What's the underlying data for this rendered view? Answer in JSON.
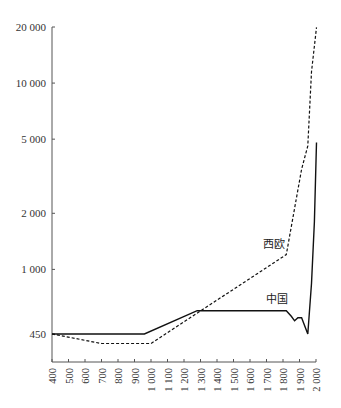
{
  "chart_data": {
    "type": "line",
    "title": "",
    "xlabel": "",
    "ylabel": "",
    "yscale": "log",
    "xlim": [
      400,
      2000
    ],
    "ylim": [
      450,
      20000
    ],
    "grid": false,
    "legend": "inline labels",
    "y_ticks": [
      {
        "value": 20000,
        "label": "20 000"
      },
      {
        "value": 10000,
        "label": "10 000"
      },
      {
        "value": 5000,
        "label": "5 000"
      },
      {
        "value": 2000,
        "label": "2 000"
      },
      {
        "value": 1000,
        "label": "1 000"
      },
      {
        "value": 450,
        "label": "450"
      }
    ],
    "x_ticks": [
      {
        "value": 400,
        "label": "400"
      },
      {
        "value": 500,
        "label": "500"
      },
      {
        "value": 600,
        "label": "600"
      },
      {
        "value": 700,
        "label": "700"
      },
      {
        "value": 800,
        "label": "800"
      },
      {
        "value": 900,
        "label": "900"
      },
      {
        "value": 1000,
        "label": "1 000"
      },
      {
        "value": 1100,
        "label": "1 100"
      },
      {
        "value": 1200,
        "label": "1 200"
      },
      {
        "value": 1300,
        "label": "1 300"
      },
      {
        "value": 1400,
        "label": "1 400"
      },
      {
        "value": 1500,
        "label": "1 500"
      },
      {
        "value": 1600,
        "label": "1 600"
      },
      {
        "value": 1700,
        "label": "1 700"
      },
      {
        "value": 1800,
        "label": "1 800"
      },
      {
        "value": 1900,
        "label": "1 900"
      },
      {
        "value": 2000,
        "label": "2 000"
      }
    ],
    "series": [
      {
        "name": "西欧",
        "style": "dashed",
        "x": [
          400,
          700,
          1000,
          1820,
          1913,
          1950,
          1973,
          2003
        ],
        "y": [
          450,
          400,
          400,
          1200,
          3450,
          4600,
          11500,
          19900
        ]
      },
      {
        "name": "中国",
        "style": "solid",
        "x": [
          400,
          960,
          1280,
          1820,
          1850,
          1870,
          1890,
          1913,
          1950,
          1973,
          1990,
          2003
        ],
        "y": [
          450,
          450,
          600,
          600,
          560,
          530,
          550,
          550,
          450,
          840,
          1800,
          4800
        ]
      }
    ]
  },
  "labels": {
    "west_europe": "西欧",
    "china": "中国"
  }
}
